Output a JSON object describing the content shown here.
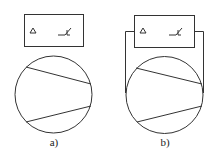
{
  "diagram": {
    "panels": [
      {
        "id": "a",
        "label": "a)",
        "box_symbols": [
          "Δ",
          "thermal-switch"
        ],
        "wired": false
      },
      {
        "id": "b",
        "label": "b)",
        "box_symbols": [
          "Δ",
          "thermal-switch"
        ],
        "wired": true
      }
    ],
    "stroke_color": "#333333"
  }
}
